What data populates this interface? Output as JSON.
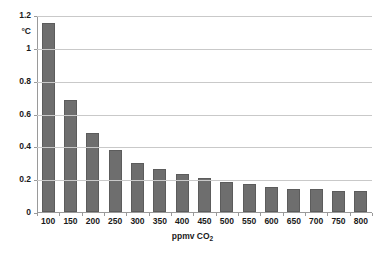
{
  "chart_data": {
    "type": "bar",
    "title": "",
    "xlabel": "ppmv CO2",
    "xlabel_base": "ppmv CO",
    "xlabel_sub": "2",
    "ylabel": "°C",
    "unit": "°C",
    "categories": [
      "100",
      "150",
      "200",
      "250",
      "300",
      "350",
      "400",
      "450",
      "500",
      "550",
      "600",
      "650",
      "700",
      "750",
      "800"
    ],
    "values": [
      1.15,
      0.68,
      0.48,
      0.38,
      0.3,
      0.26,
      0.23,
      0.21,
      0.18,
      0.17,
      0.15,
      0.14,
      0.14,
      0.13,
      0.13
    ],
    "ylim": [
      0,
      1.2
    ],
    "yticks": [
      "0",
      "0.2",
      "0.4",
      "0.6",
      "0.8",
      "1",
      "1.2"
    ],
    "ytick_values": [
      0,
      0.2,
      0.4,
      0.6,
      0.8,
      1,
      1.2
    ],
    "grid": true,
    "legend": "none",
    "bar_color": "#6e6e6e",
    "bar_border_color": "#5c5c5c",
    "gridline_color": "#c9c9c9",
    "axis_color": "#9a9a9a",
    "text_color": "#1a1a1a",
    "background": "#ffffff"
  }
}
